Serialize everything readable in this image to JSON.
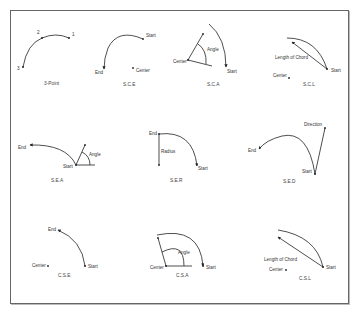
{
  "figure": {
    "frame_color": "#555555",
    "line_color": "#222222",
    "panels": [
      {
        "id": "3-point",
        "caption": "3-Point",
        "labels": {
          "p1": "1",
          "p2": "2",
          "p3": "3"
        }
      },
      {
        "id": "sce",
        "caption": "S.C.E",
        "labels": {
          "start": "Start",
          "end": "End",
          "center": "Center"
        }
      },
      {
        "id": "sca",
        "caption": "S.C.A",
        "labels": {
          "start": "Start",
          "center": "Center",
          "angle": "Angle"
        }
      },
      {
        "id": "scl",
        "caption": "S.C.L",
        "labels": {
          "start": "Start",
          "center": "Center",
          "chord": "Length of Chord"
        }
      },
      {
        "id": "sea",
        "caption": "S.E.A",
        "labels": {
          "start": "Start",
          "end": "End",
          "angle": "Angle"
        }
      },
      {
        "id": "ser",
        "caption": "S.E.R",
        "labels": {
          "start": "Start",
          "end": "End",
          "radius": "Radius"
        }
      },
      {
        "id": "sed",
        "caption": "S.E.D",
        "labels": {
          "start": "Start",
          "end": "End",
          "direction": "Direction"
        }
      },
      {
        "id": "cse",
        "caption": "C.S.E",
        "labels": {
          "start": "Start",
          "end": "End",
          "center": "Center"
        }
      },
      {
        "id": "csa",
        "caption": "C.S.A",
        "labels": {
          "start": "Start",
          "center": "Center",
          "angle": "Angle"
        }
      },
      {
        "id": "csl",
        "caption": "C.S.L",
        "labels": {
          "start": "Start",
          "center": "Center",
          "chord": "Length of Chord"
        }
      }
    ]
  }
}
